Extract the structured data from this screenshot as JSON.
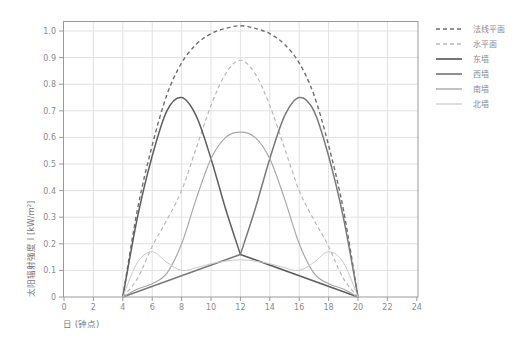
{
  "chart_data": {
    "type": "line",
    "title": "",
    "xlabel": "日 (钟点)",
    "ylabel": "太阳辐射强度 I [kW/m²]",
    "xlim": [
      0,
      24
    ],
    "ylim": [
      0,
      1.04
    ],
    "grid": true,
    "legend_position": "right",
    "x_ticks": [
      0,
      2,
      4,
      6,
      8,
      10,
      12,
      14,
      16,
      18,
      20,
      22,
      24
    ],
    "y_ticks": [
      0,
      0.1,
      0.2,
      0.3,
      0.4,
      0.5,
      0.6,
      0.7,
      0.8,
      0.9,
      1.0
    ],
    "y_tick_labels": [
      "0",
      "0.1",
      "0.2",
      "0.3",
      "0.4",
      "0.5",
      "0.6",
      "0.7",
      "0.8",
      "0.9",
      "1.0"
    ],
    "series": [
      {
        "name": "法线平面",
        "style": "dashed",
        "color": "#6e6e6e",
        "width": 1.4,
        "x": [
          4,
          5,
          6,
          7,
          8,
          9,
          10,
          11,
          12,
          13,
          14,
          15,
          16,
          17,
          18,
          19,
          20
        ],
        "values": [
          0,
          0.33,
          0.57,
          0.76,
          0.88,
          0.95,
          0.99,
          1.01,
          1.02,
          1.01,
          0.99,
          0.95,
          0.88,
          0.76,
          0.57,
          0.33,
          0
        ]
      },
      {
        "name": "水平面",
        "style": "dashed",
        "color": "#b8b8b8",
        "width": 1.2,
        "x": [
          4,
          5,
          6,
          7,
          8,
          9,
          10,
          11,
          12,
          13,
          14,
          15,
          16,
          17,
          18,
          19,
          20
        ],
        "values": [
          0,
          0.07,
          0.19,
          0.29,
          0.4,
          0.56,
          0.72,
          0.84,
          0.89,
          0.84,
          0.72,
          0.56,
          0.4,
          0.29,
          0.19,
          0.07,
          0
        ]
      },
      {
        "name": "东墙",
        "style": "solid",
        "color": "#5e5e5e",
        "width": 1.5,
        "x": [
          4,
          5,
          6,
          7,
          8,
          9,
          10,
          11,
          12,
          13,
          14,
          15,
          16,
          17,
          18,
          19,
          20
        ],
        "values": [
          0,
          0.3,
          0.53,
          0.7,
          0.75,
          0.68,
          0.52,
          0.33,
          0.16,
          0.145,
          0.13,
          0.115,
          0.1,
          0.075,
          0.05,
          0.025,
          0
        ]
      },
      {
        "name": "西墙",
        "style": "solid",
        "color": "#7a7a7a",
        "width": 1.5,
        "x": [
          4,
          5,
          6,
          7,
          8,
          9,
          10,
          11,
          12,
          13,
          14,
          15,
          16,
          17,
          18,
          19,
          20
        ],
        "values": [
          0,
          0.025,
          0.05,
          0.075,
          0.1,
          0.115,
          0.13,
          0.145,
          0.16,
          0.33,
          0.52,
          0.68,
          0.75,
          0.7,
          0.53,
          0.3,
          0
        ]
      },
      {
        "name": "南墙",
        "style": "solid",
        "color": "#a8a8a8",
        "width": 1.2,
        "x": [
          4,
          5,
          6,
          7,
          8,
          9,
          10,
          11,
          12,
          13,
          14,
          15,
          16,
          17,
          18,
          19,
          20
        ],
        "values": [
          0,
          0.03,
          0.05,
          0.09,
          0.2,
          0.37,
          0.52,
          0.6,
          0.62,
          0.6,
          0.52,
          0.37,
          0.2,
          0.09,
          0.05,
          0.03,
          0
        ]
      },
      {
        "name": "北墙",
        "style": "solid",
        "color": "#c8c8c8",
        "width": 1.0,
        "x": [
          4,
          5,
          6,
          7,
          8,
          9,
          10,
          11,
          12,
          13,
          14,
          15,
          16,
          17,
          18,
          19,
          20
        ],
        "values": [
          0,
          0.13,
          0.17,
          0.13,
          0.1,
          0.11,
          0.125,
          0.135,
          0.14,
          0.135,
          0.125,
          0.11,
          0.1,
          0.13,
          0.17,
          0.13,
          0
        ]
      }
    ]
  }
}
